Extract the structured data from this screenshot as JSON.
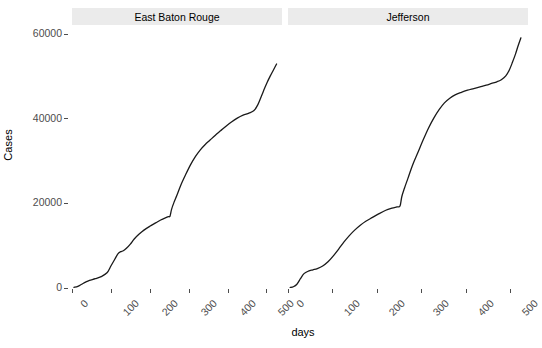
{
  "chart_data": {
    "type": "line",
    "title": "",
    "xlabel": "days",
    "ylabel": "Cases",
    "xlim": [
      0,
      540
    ],
    "ylim": [
      0,
      62000
    ],
    "grid": false,
    "legend": false,
    "facets": [
      "East Baton Rouge",
      "Jefferson"
    ],
    "x_ticks": [
      0,
      100,
      200,
      300,
      400,
      500
    ],
    "y_ticks": [
      0,
      20000,
      40000,
      60000
    ],
    "y_tick_labels": [
      "0",
      "20000",
      "40000",
      "60000"
    ],
    "x_tick_labels": [
      "0",
      "100",
      "200",
      "300",
      "400",
      "500"
    ],
    "line_color": "#1a1a1a",
    "panel_background": "#ffffff",
    "strip_background": "#ebebeb",
    "series": [
      {
        "name": "East Baton Rouge",
        "x": [
          5,
          15,
          25,
          35,
          45,
          60,
          75,
          90,
          100,
          110,
          118,
          125,
          132,
          140,
          150,
          160,
          172,
          185,
          200,
          215,
          228,
          240,
          248,
          252,
          256,
          262,
          270,
          280,
          292,
          305,
          318,
          330,
          342,
          355,
          368,
          382,
          396,
          410,
          425,
          440,
          455,
          468,
          478,
          488,
          495,
          502,
          510,
          518,
          526
        ],
        "y": [
          150,
          400,
          900,
          1400,
          1800,
          2200,
          2700,
          3600,
          5200,
          6800,
          8100,
          8600,
          8800,
          9400,
          10400,
          11600,
          12700,
          13700,
          14600,
          15400,
          16100,
          16600,
          16900,
          17000,
          18600,
          20200,
          22000,
          24400,
          26800,
          29200,
          31200,
          32700,
          33900,
          35000,
          36100,
          37200,
          38300,
          39300,
          40200,
          40900,
          41400,
          42000,
          43400,
          45600,
          47200,
          48700,
          50200,
          51600,
          53000
        ]
      },
      {
        "name": "Jefferson",
        "x": [
          5,
          12,
          20,
          28,
          36,
          46,
          56,
          66,
          78,
          90,
          102,
          114,
          126,
          138,
          150,
          162,
          175,
          190,
          205,
          220,
          234,
          245,
          252,
          256,
          262,
          270,
          280,
          292,
          304,
          316,
          328,
          340,
          352,
          364,
          376,
          390,
          404,
          418,
          432,
          446,
          458,
          470,
          480,
          490,
          498,
          505,
          512,
          518,
          524
        ],
        "y": [
          120,
          300,
          900,
          2200,
          3400,
          4000,
          4300,
          4600,
          5200,
          6200,
          7600,
          9200,
          10900,
          12400,
          13700,
          14800,
          15800,
          16700,
          17600,
          18400,
          18900,
          19200,
          19400,
          21600,
          23600,
          26000,
          29000,
          32000,
          35000,
          37800,
          40200,
          42200,
          43800,
          44900,
          45700,
          46300,
          46800,
          47200,
          47600,
          48000,
          48400,
          48800,
          49300,
          50200,
          51600,
          53400,
          55400,
          57400,
          59200
        ]
      }
    ]
  }
}
